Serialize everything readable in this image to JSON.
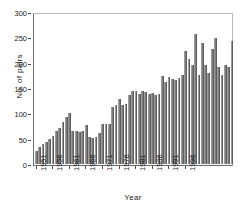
{
  "chart_data": {
    "type": "bar",
    "title": "",
    "subtitle": "",
    "xlabel": "Year",
    "ylabel": "No. of pairs",
    "ylim": [
      0,
      300
    ],
    "yticks": [
      0,
      50,
      100,
      150,
      200,
      250,
      300
    ],
    "xticks": [
      "1951",
      "1956",
      "1961",
      "1966",
      "1971",
      "1976",
      "1981",
      "1986",
      "1991",
      "1996"
    ],
    "xtick_years": [
      1951,
      1956,
      1961,
      1966,
      1971,
      1976,
      1981,
      1986,
      1991,
      1996
    ],
    "grid": false,
    "legend": null,
    "bar_color": "#7d7d7d",
    "categories": [
      "1951",
      "1952",
      "1953",
      "1954",
      "1955",
      "1956",
      "1957",
      "1958",
      "1959",
      "1960",
      "1961",
      "1962",
      "1963",
      "1964",
      "1965",
      "1966",
      "1967",
      "1968",
      "1969",
      "1970",
      "1971",
      "1972",
      "1973",
      "1974",
      "1975",
      "1976",
      "1977",
      "1978",
      "1979",
      "1980",
      "1981",
      "1982",
      "1983",
      "1984",
      "1985",
      "1986",
      "1987",
      "1988",
      "1989",
      "1990",
      "1991",
      "1992",
      "1993",
      "1994",
      "1995",
      "1996",
      "1997",
      "1998",
      "1999",
      "2000"
    ],
    "values": [
      25,
      33,
      39,
      44,
      50,
      55,
      66,
      72,
      84,
      94,
      101,
      66,
      65,
      64,
      66,
      77,
      54,
      51,
      53,
      62,
      79,
      80,
      80,
      113,
      118,
      129,
      117,
      119,
      137,
      146,
      145,
      140,
      145,
      143,
      140,
      142,
      138,
      140,
      174,
      163,
      173,
      168,
      167,
      170,
      177,
      225,
      209,
      196,
      259,
      177
    ],
    "values_tail": [
      240,
      196,
      181,
      228,
      251,
      193,
      177,
      197,
      192,
      245
    ]
  }
}
